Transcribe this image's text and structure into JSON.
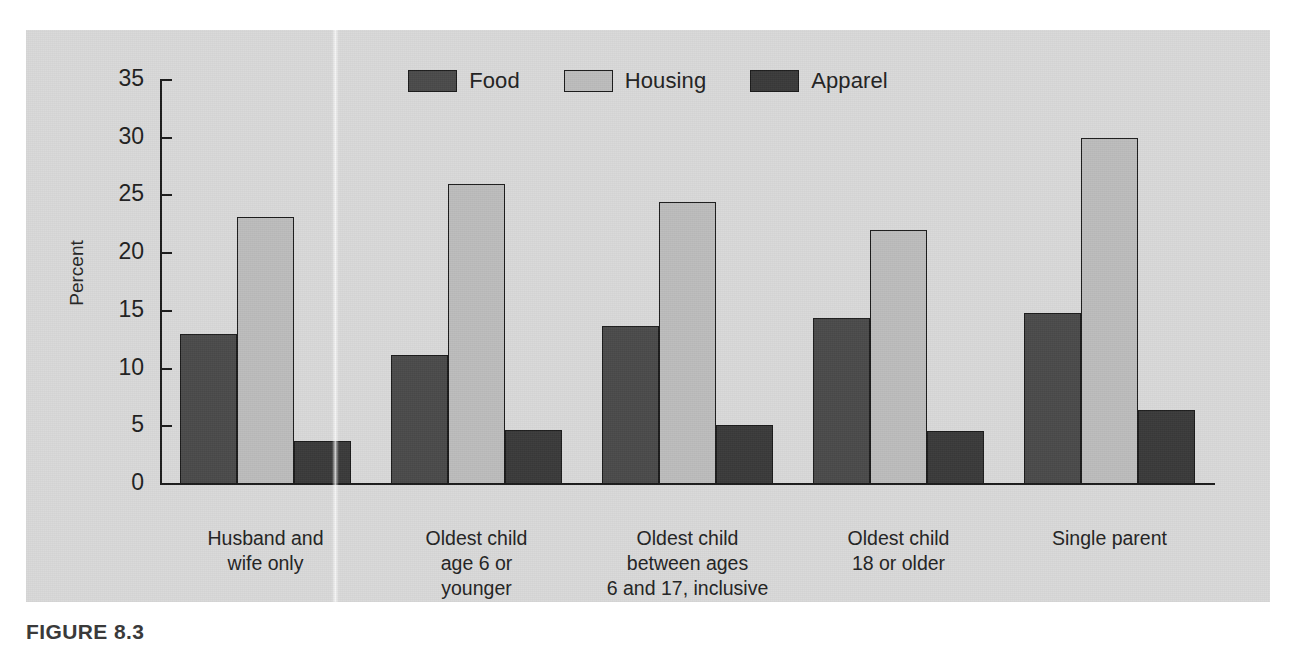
{
  "caption": "FIGURE 8.3",
  "legend": {
    "position": "top-center",
    "entries": [
      {
        "label": "Food",
        "color": "#4a4a4a"
      },
      {
        "label": "Housing",
        "color": "#bcbcbc"
      },
      {
        "label": "Apparel",
        "color": "#3a3a3a"
      }
    ]
  },
  "axes": {
    "ylabel": "Percent",
    "yticks": [
      "0",
      "5",
      "10",
      "15",
      "20",
      "25",
      "30",
      "35"
    ],
    "ymin": 0,
    "ymax": 35
  },
  "chart_data": {
    "type": "bar",
    "title": "",
    "xlabel": "",
    "ylabel": "Percent",
    "ylim": [
      0,
      35
    ],
    "ytick_step": 5,
    "grid": false,
    "legend_position": "top-center",
    "categories": [
      "Husband and\nwife only",
      "Oldest child\nage 6 or\nyounger",
      "Oldest child\nbetween ages\n6 and 17, inclusive",
      "Oldest child\n18 or older",
      "Single parent"
    ],
    "category_lines": [
      [
        "Husband and",
        "wife only"
      ],
      [
        "Oldest child",
        "age 6 or",
        "younger"
      ],
      [
        "Oldest child",
        "between ages",
        "6 and 17, inclusive"
      ],
      [
        "Oldest child",
        "18 or older"
      ],
      [
        "Single parent"
      ]
    ],
    "series": [
      {
        "name": "Food",
        "color": "#4a4a4a",
        "values": [
          13.0,
          11.2,
          13.7,
          14.4,
          14.8
        ]
      },
      {
        "name": "Housing",
        "color": "#bcbcbc",
        "values": [
          23.1,
          26.0,
          24.4,
          22.0,
          30.0
        ]
      },
      {
        "name": "Apparel",
        "color": "#3a3a3a",
        "values": [
          3.7,
          4.7,
          5.1,
          4.6,
          6.4
        ]
      }
    ]
  }
}
